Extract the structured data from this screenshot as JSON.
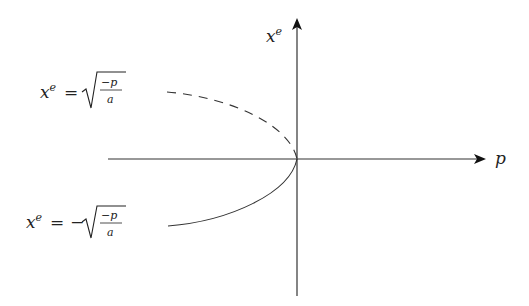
{
  "diagram": {
    "type": "bifurcation-diagram",
    "axes": {
      "horizontal": {
        "label": "p"
      },
      "vertical": {
        "label": "x",
        "label_superscript": "e"
      }
    },
    "branches": [
      {
        "name": "upper",
        "style": "dashed",
        "equation_lhs": "x",
        "equation_lhs_sup": "e",
        "equation_eq": "=",
        "equation_sign": "",
        "frac_num": "−p",
        "frac_den": "a"
      },
      {
        "name": "lower",
        "style": "solid",
        "equation_lhs": "x",
        "equation_lhs_sup": "e",
        "equation_eq": "=",
        "equation_sign": "−",
        "frac_num": "−p",
        "frac_den": "a"
      }
    ],
    "colors": {
      "stroke": "#222222",
      "background": "#ffffff"
    }
  }
}
